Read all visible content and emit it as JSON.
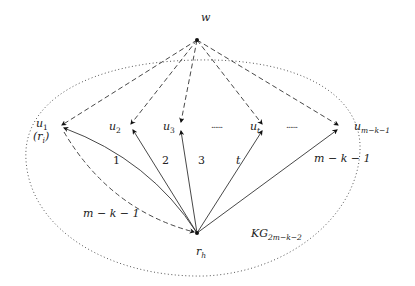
{
  "diagram": {
    "nodes": {
      "w": {
        "label": "w"
      },
      "u1": {
        "label": "u",
        "sub": "1",
        "alt": "(r",
        "alt_sub": "i",
        "alt_close": ")"
      },
      "u2": {
        "label": "u",
        "sub": "2"
      },
      "u3": {
        "label": "u",
        "sub": "3"
      },
      "ut": {
        "label": "u",
        "sub": "t"
      },
      "um": {
        "label": "u",
        "sub": "m−k−1"
      },
      "rh": {
        "label": "r",
        "sub": "h"
      }
    },
    "ellipsis": [
      "......",
      "......"
    ],
    "edge_labels": {
      "e1": "1",
      "e2": "2",
      "e3": "3",
      "et": "t",
      "em": "m − k − 1",
      "dashed_return": "m − k − 1"
    },
    "region_label": {
      "main": "KG",
      "sub": "2m−k−2"
    },
    "colors": {
      "line": "#333333",
      "dotted": "#555555",
      "node": "#111111"
    }
  }
}
